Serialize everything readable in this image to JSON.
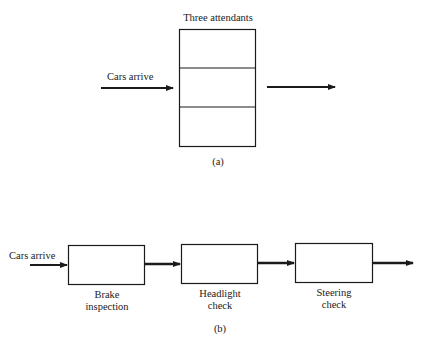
{
  "diagram_a": {
    "title": "Three attendants",
    "input_label": "Cars arrive",
    "caption": "(a)",
    "attendant_count": 3
  },
  "diagram_b": {
    "input_label": "Cars arrive",
    "stations": [
      {
        "line1": "Brake",
        "line2": "inspection"
      },
      {
        "line1": "Headlight",
        "line2": "check"
      },
      {
        "line1": "Steering",
        "line2": "check"
      }
    ],
    "caption": "(b)"
  }
}
